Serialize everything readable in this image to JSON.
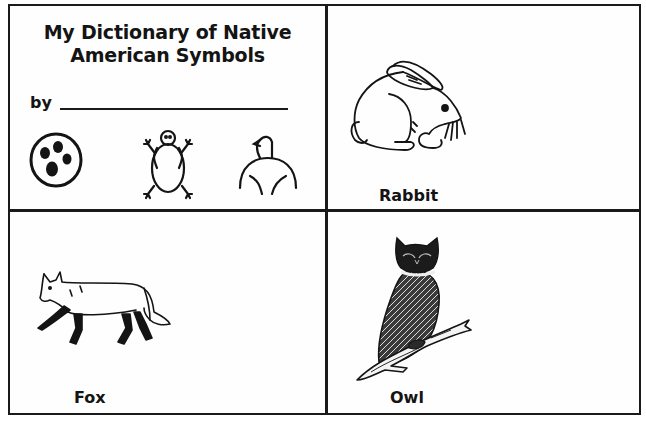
{
  "page": {
    "title_line1": "My Dictionary of Native",
    "title_line2": "American Symbols",
    "by_label": "by",
    "name_field_value": ""
  },
  "cover_symbols": [
    {
      "name": "bear-track-symbol",
      "description": "circle with four dots"
    },
    {
      "name": "turtle-symbol",
      "description": "stick-figure turtle"
    },
    {
      "name": "eagle-symbol",
      "description": "eagle head and arched wings"
    }
  ],
  "cards": [
    {
      "id": "rabbit",
      "label": "Rabbit",
      "illustration": "rabbit-illustration"
    },
    {
      "id": "fox",
      "label": "Fox",
      "illustration": "fox-illustration"
    },
    {
      "id": "owl",
      "label": "Owl",
      "illustration": "owl-illustration"
    }
  ],
  "colors": {
    "ink": "#1a1a1a",
    "paper": "#fefefe"
  }
}
